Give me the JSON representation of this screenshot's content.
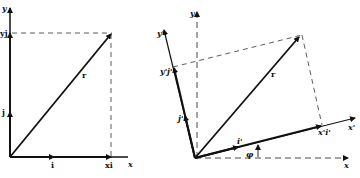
{
  "left_diagram": {
    "axis_x_label": "x",
    "axis_y_label": "y",
    "unit_i_label": "i",
    "unit_j_label": "j",
    "component_x_label": "xi",
    "component_y_label": "yj",
    "vector_label": "r"
  },
  "right_diagram": {
    "axis_x_label": "x",
    "axis_y_label": "y",
    "axis_x_prime_label": "x'",
    "axis_y_prime_label": "y'",
    "unit_i_prime_label": "i'",
    "unit_j_prime_label": "j'",
    "component_x_prime_label": "x'i'",
    "component_y_prime_label": "y'j'",
    "vector_label": "r",
    "angle_label": "φ"
  },
  "colors": {
    "ink": "#111111",
    "background": "#ffffff"
  }
}
